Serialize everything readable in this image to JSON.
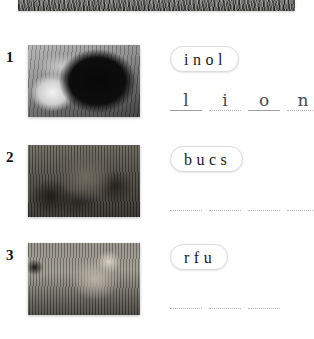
{
  "page": {
    "background_color": "#ffffff",
    "banner": {
      "image_alt": "savanna-grass-photo-cropped"
    }
  },
  "exercises": [
    {
      "number": "1",
      "image_alt": "lion-face-photo",
      "scrambled": "inol",
      "answer_letters": [
        "l",
        "i",
        "o",
        "n"
      ],
      "blank_count": 4,
      "filled": true
    },
    {
      "number": "2",
      "image_alt": "lioness-with-cubs-photo",
      "scrambled": "bucs",
      "answer_letters": [
        "",
        "",
        "",
        ""
      ],
      "blank_count": 4,
      "filled": false
    },
    {
      "number": "3",
      "image_alt": "lioness-in-grass-photo",
      "scrambled": "rfu",
      "answer_letters": [
        "",
        "",
        ""
      ],
      "blank_count": 3,
      "filled": false
    }
  ],
  "colors": {
    "text": "#1a1a1a",
    "chip_border": "#dcdcdc",
    "blank_rule": "#b9b9b9",
    "letter": "#4a4a4a"
  }
}
